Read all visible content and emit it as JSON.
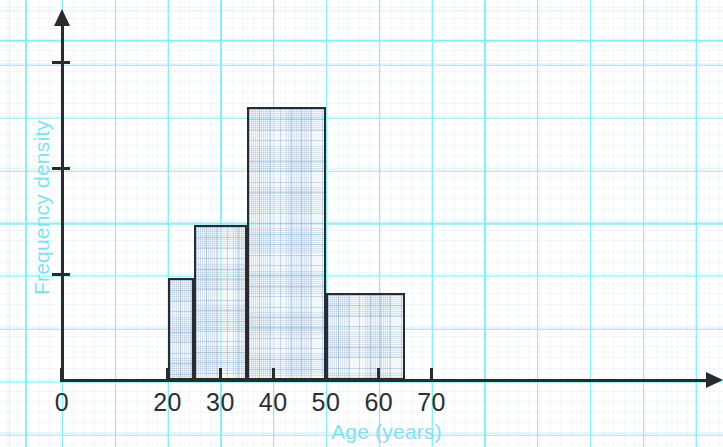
{
  "chart_data": {
    "type": "bar",
    "title": "",
    "subtitle": "",
    "xlabel": "Age (years)",
    "ylabel": "Frequency density",
    "xlim": [
      0,
      72
    ],
    "ylim": [
      0,
      3.5
    ],
    "xticks": [
      0,
      20,
      30,
      40,
      50,
      60,
      70
    ],
    "xtick_labels": [
      "0",
      "20",
      "30",
      "40",
      "50",
      "60",
      "70"
    ],
    "yticks": [
      1,
      2,
      3
    ],
    "ytick_labels": [
      "",
      "",
      ""
    ],
    "grid": true,
    "grid_style": "graph-paper",
    "legend": null,
    "annotations": [],
    "bins": [
      {
        "label": "20-25",
        "start": 20,
        "end": 25,
        "frequency_density": 0.97
      },
      {
        "label": "25-35",
        "start": 25,
        "end": 35,
        "frequency_density": 1.47
      },
      {
        "label": "35-50",
        "start": 35,
        "end": 50,
        "frequency_density": 2.58
      },
      {
        "label": "50-65",
        "start": 50,
        "end": 65,
        "frequency_density": 0.82
      }
    ]
  },
  "axes": {
    "x_title": "Age (years)",
    "y_title": "Frequency density",
    "x_tick_labels": [
      "0",
      "20",
      "30",
      "40",
      "50",
      "60",
      "70"
    ]
  },
  "colors": {
    "axis": "#2b2b2e",
    "axis_title": "#7fe3ef",
    "tick_label": "#2e2e31",
    "grid_major": "#82ecf4",
    "grid_minor": "#8cc8e8",
    "bar_outline": "#2b2b2e",
    "background": "#ffffff"
  }
}
